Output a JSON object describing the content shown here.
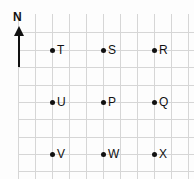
{
  "diagram": {
    "type": "compass-grid-map",
    "compass": {
      "label": "N",
      "direction": "up"
    },
    "grid": {
      "vertical_lines_x": [
        18,
        35,
        52,
        69,
        86,
        103,
        120,
        137,
        154,
        171,
        188
      ],
      "horizontal_lines_y": [
        32,
        50,
        67,
        85,
        102,
        119,
        137,
        154,
        171
      ],
      "line_color": "#d6d6d6"
    },
    "points": [
      {
        "label": "T",
        "x": 52,
        "y": 50
      },
      {
        "label": "S",
        "x": 103,
        "y": 50
      },
      {
        "label": "R",
        "x": 154,
        "y": 50
      },
      {
        "label": "U",
        "x": 52,
        "y": 102
      },
      {
        "label": "P",
        "x": 103,
        "y": 102
      },
      {
        "label": "Q",
        "x": 154,
        "y": 102
      },
      {
        "label": "V",
        "x": 52,
        "y": 154
      },
      {
        "label": "W",
        "x": 103,
        "y": 154
      },
      {
        "label": "X",
        "x": 154,
        "y": 154
      }
    ],
    "point_color": "#111111"
  }
}
